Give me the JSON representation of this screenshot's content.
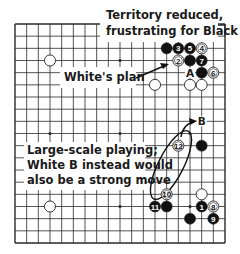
{
  "diagram": {
    "type": "go-board-diagram",
    "board_size": 19,
    "colors": {
      "line": "#2a2a2a",
      "black_stone": "#111111",
      "white_stone": "#ffffff",
      "stone_outline": "#222222",
      "background": "#ffffff"
    },
    "geometry": {
      "left": 15,
      "right": 225,
      "top": 24,
      "bottom": 243
    },
    "star_points": [
      [
        3,
        3
      ],
      [
        9,
        3
      ],
      [
        15,
        3
      ],
      [
        3,
        9
      ],
      [
        9,
        9
      ],
      [
        15,
        9
      ],
      [
        3,
        15
      ],
      [
        9,
        15
      ],
      [
        15,
        15
      ]
    ],
    "stones": [
      {
        "color": "white",
        "col": 3,
        "row": 3,
        "label": ""
      },
      {
        "color": "white",
        "col": 3,
        "row": 15,
        "label": ""
      },
      {
        "color": "white",
        "col": 12,
        "row": 5,
        "label": ""
      },
      {
        "color": "black",
        "col": 13,
        "row": 2,
        "label": ""
      },
      {
        "color": "black",
        "col": 14,
        "row": 2,
        "label": "3"
      },
      {
        "color": "black",
        "col": 15,
        "row": 2,
        "label": "5"
      },
      {
        "color": "white",
        "col": 16,
        "row": 2,
        "label": "4"
      },
      {
        "color": "white",
        "col": 14,
        "row": 3,
        "label": "2"
      },
      {
        "color": "black",
        "col": 15,
        "row": 3,
        "label": ""
      },
      {
        "color": "black",
        "col": 16,
        "row": 3,
        "label": "7"
      },
      {
        "color": "black",
        "col": 16,
        "row": 4,
        "label": ""
      },
      {
        "color": "white",
        "col": 17,
        "row": 4,
        "label": "6"
      },
      {
        "color": "white",
        "col": 15,
        "row": 5,
        "label": ""
      },
      {
        "color": "white",
        "col": 16,
        "row": 5,
        "label": ""
      },
      {
        "color": "white",
        "col": 14,
        "row": 10,
        "label": "12"
      },
      {
        "color": "black",
        "col": 16,
        "row": 10,
        "label": ""
      },
      {
        "color": "white",
        "col": 13,
        "row": 14,
        "label": "10"
      },
      {
        "color": "white",
        "col": 16,
        "row": 14,
        "label": ""
      },
      {
        "color": "black",
        "col": 12,
        "row": 15,
        "label": "11"
      },
      {
        "color": "black",
        "col": 13,
        "row": 15,
        "label": ""
      },
      {
        "color": "black",
        "col": 16,
        "row": 15,
        "label": "1"
      },
      {
        "color": "white",
        "col": 17,
        "row": 15,
        "label": "8"
      },
      {
        "color": "black",
        "col": 15,
        "row": 16,
        "label": ""
      },
      {
        "color": "black",
        "col": 17,
        "row": 16,
        "label": "9"
      }
    ],
    "point_labels": [
      {
        "text": "A",
        "col": 15,
        "row": 4
      },
      {
        "text": "B",
        "col": 16,
        "row": 8
      }
    ],
    "annotations": {
      "top_note": [
        "Territory reduced,",
        "frustrating for Black"
      ],
      "plan_note": "White's plan",
      "large_scale_note": [
        "Large-scale playing;",
        "White B instead would",
        "also be a strong move"
      ]
    }
  }
}
